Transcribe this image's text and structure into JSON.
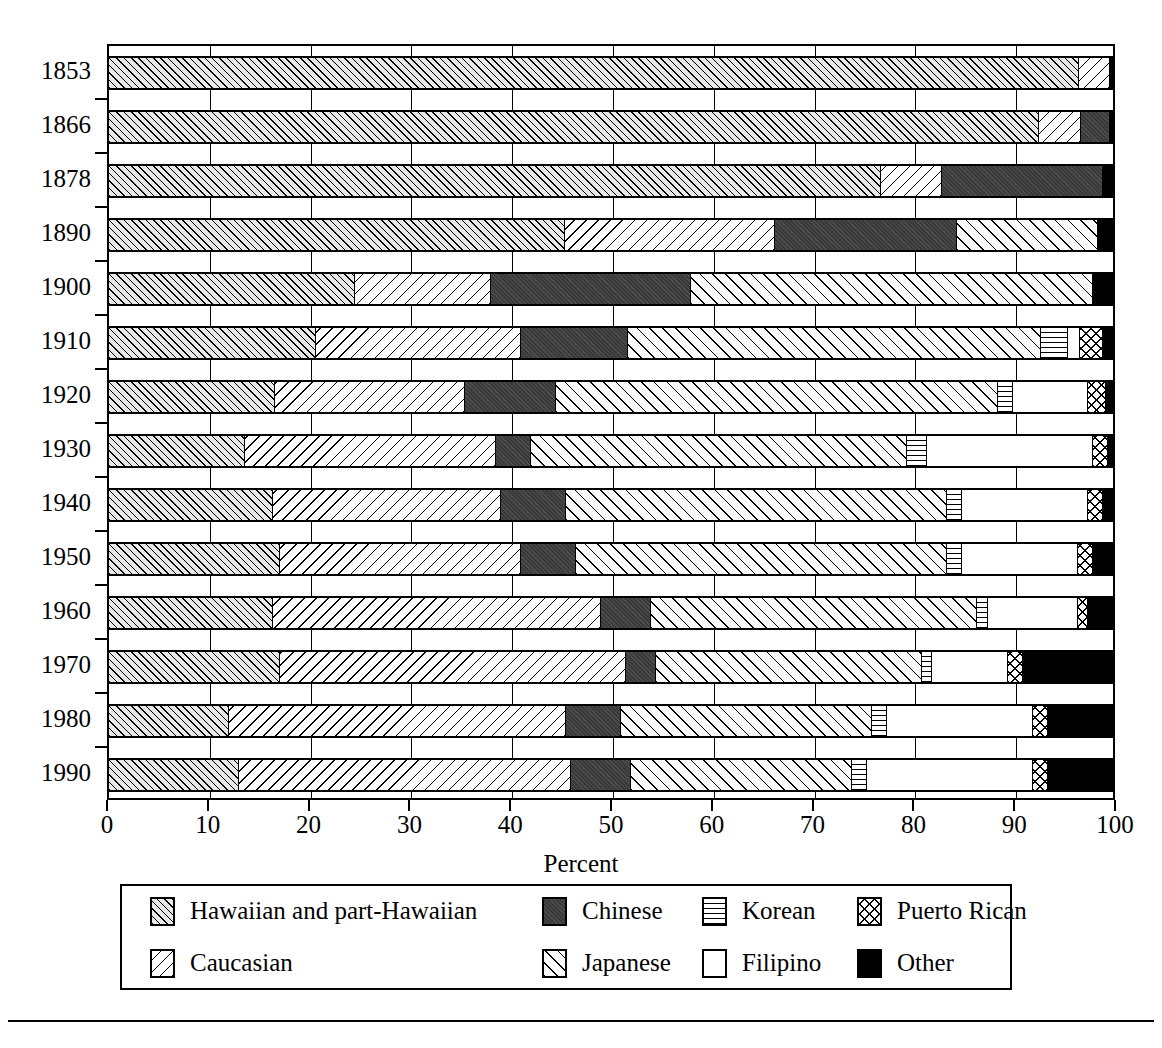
{
  "chart_data": {
    "type": "bar",
    "subtype": "horizontal-stacked-100-percent",
    "title": "",
    "xlabel": "Percent",
    "ylabel": "",
    "xlim": [
      0,
      100
    ],
    "xticks": [
      0,
      10,
      20,
      30,
      40,
      50,
      60,
      70,
      80,
      90,
      100
    ],
    "xtick_labels": [
      "0",
      "10",
      "20",
      "30",
      "40",
      "50",
      "60",
      "70",
      "80",
      "90",
      "100"
    ],
    "grid": true,
    "grid_axis": "x",
    "legend_position": "below-axes",
    "legend_columns": 4,
    "categories": [
      "1853",
      "1866",
      "1878",
      "1890",
      "1900",
      "1910",
      "1920",
      "1930",
      "1940",
      "1950",
      "1960",
      "1970",
      "1980",
      "1990"
    ],
    "series": [
      {
        "name": "Hawaiian and part-Hawaiian",
        "pattern": "diagonal-dense-forward",
        "values": [
          96.6,
          92.6,
          81.5,
          45.4,
          24.5,
          20.6,
          16.5,
          13.5,
          16.3,
          17.0,
          16.3,
          17.0,
          12.0,
          12.9
        ]
      },
      {
        "name": "Caucasian",
        "pattern": "diagonal-backslash",
        "values": [
          3.1,
          4.2,
          6.5,
          20.9,
          13.5,
          20.4,
          19.0,
          25.0,
          22.7,
          24.0,
          32.7,
          34.5,
          33.5,
          33.1
        ]
      },
      {
        "name": "Chinese",
        "pattern": "solid-dark-gray",
        "values": [
          0.0,
          2.9,
          16.9,
          18.2,
          20.0,
          10.7,
          9.0,
          3.5,
          6.5,
          5.5,
          5.0,
          3.0,
          5.5,
          6.0
        ]
      },
      {
        "name": "Japanese",
        "pattern": "diagonal-sparse-forward",
        "values": [
          0.0,
          0.0,
          0.0,
          14.0,
          40.0,
          41.1,
          44.0,
          37.5,
          38.0,
          37.0,
          32.5,
          26.5,
          25.0,
          22.0
        ]
      },
      {
        "name": "Korean",
        "pattern": "horizontal-lines",
        "values": [
          0.0,
          0.0,
          0.0,
          0.0,
          0.0,
          2.7,
          1.5,
          2.0,
          1.5,
          1.5,
          1.0,
          1.0,
          1.5,
          1.5
        ]
      },
      {
        "name": "Filipino",
        "pattern": "white",
        "values": [
          0.0,
          0.0,
          0.0,
          0.0,
          0.0,
          1.2,
          7.5,
          16.5,
          12.5,
          11.5,
          9.0,
          7.5,
          14.5,
          16.5
        ]
      },
      {
        "name": "Puerto Rican",
        "pattern": "crosshatch",
        "values": [
          0.0,
          0.0,
          0.0,
          0.0,
          0.0,
          2.3,
          1.8,
          1.5,
          1.5,
          1.5,
          1.0,
          1.5,
          1.5,
          1.5
        ]
      },
      {
        "name": "Other",
        "pattern": "solid-black",
        "values": [
          0.3,
          0.3,
          1.1,
          1.5,
          2.0,
          1.0,
          0.7,
          0.5,
          1.0,
          2.0,
          2.5,
          9.0,
          6.5,
          6.5
        ]
      }
    ]
  },
  "axes": {
    "x_title": "Percent",
    "x_tick_labels": [
      "0",
      "10",
      "20",
      "30",
      "40",
      "50",
      "60",
      "70",
      "80",
      "90",
      "100"
    ],
    "y_tick_labels": [
      "1853",
      "1866",
      "1878",
      "1890",
      "1900",
      "1910",
      "1920",
      "1930",
      "1940",
      "1950",
      "1960",
      "1970",
      "1980",
      "1990"
    ]
  },
  "legend": {
    "items": [
      {
        "label": "Hawaiian and part-Hawaiian",
        "swatch": "pat-hawaiian"
      },
      {
        "label": "Chinese",
        "swatch": "pat-chinese"
      },
      {
        "label": "Korean",
        "swatch": "pat-korean"
      },
      {
        "label": "Puerto Rican",
        "swatch": "pat-puertorican"
      },
      {
        "label": "Caucasian",
        "swatch": "pat-caucasian"
      },
      {
        "label": "Japanese",
        "swatch": "pat-japanese"
      },
      {
        "label": "Filipino",
        "swatch": "pat-filipino"
      },
      {
        "label": "Other",
        "swatch": "pat-other"
      }
    ]
  },
  "colors": {
    "ink": "#000000",
    "paper": "#ffffff",
    "chinese_fill": "#3a3a3a",
    "other_fill": "#000000",
    "hawaiian_fill": "#e8e8e8"
  }
}
